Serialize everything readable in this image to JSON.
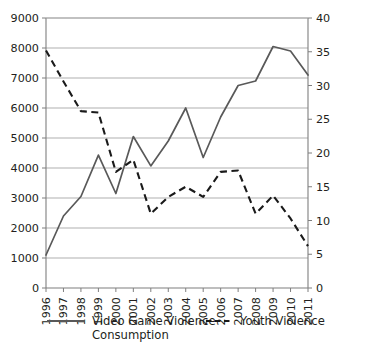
{
  "chart_data": {
    "type": "line",
    "title": "",
    "subtitle": "",
    "xlabel": "",
    "ylabel": "",
    "grid": true,
    "legend_position": "bottom",
    "x": [
      "1996",
      "1997",
      "1998",
      "1999",
      "2000",
      "2001",
      "2002",
      "2003",
      "2004",
      "2005",
      "2006",
      "2007",
      "2008",
      "2009",
      "2010",
      "2011"
    ],
    "axes": {
      "left": {
        "label": "",
        "min": 0,
        "max": 9000,
        "step": 1000,
        "ticks": [
          "0",
          "1000",
          "2000",
          "3000",
          "4000",
          "5000",
          "6000",
          "7000",
          "8000",
          "9000"
        ]
      },
      "right": {
        "label": "",
        "min": 0,
        "max": 40,
        "step": 5,
        "ticks": [
          "0",
          "5",
          "10",
          "15",
          "20",
          "25",
          "30",
          "35",
          "40"
        ]
      }
    },
    "series": [
      {
        "name": "Video Game Violence Consumption",
        "axis": "left",
        "style": "solid",
        "color": "#595959",
        "values": [
          1100,
          2400,
          3050,
          4430,
          3150,
          5050,
          4070,
          4900,
          6000,
          4350,
          5700,
          6750,
          6900,
          8050,
          7900,
          7100
        ]
      },
      {
        "name": "Youth Violence",
        "axis": "right",
        "style": "dashed",
        "color": "#1a1a1a",
        "values": [
          35.2,
          30.6,
          26.2,
          26.0,
          17.2,
          19.0,
          11.0,
          13.5,
          15.0,
          13.5,
          17.2,
          17.4,
          11.0,
          13.7,
          10.3,
          6.2
        ]
      }
    ],
    "legend": [
      {
        "label_line1": "Video Game Violence",
        "label_line2": "Consumption",
        "style": "solid"
      },
      {
        "label_line1": "Youth Violence",
        "label_line2": "",
        "style": "dashed"
      }
    ]
  }
}
